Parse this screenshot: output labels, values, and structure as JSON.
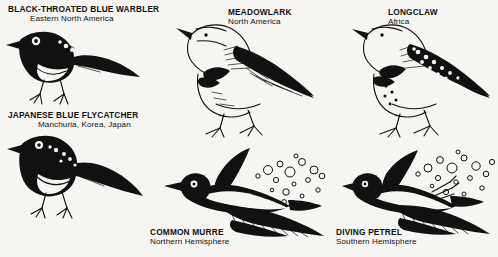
{
  "plate": {
    "title": "Convergent evolution in birds",
    "background_color": "#f6f5f1",
    "ink_color": "#111111",
    "style": "black-and-white scanned line engraving"
  },
  "specimens": [
    {
      "id": "black-throated-blue-warbler",
      "name": "BLACK-THROATED BLUE WARBLER",
      "range": "Eastern North America",
      "pose": "perched, facing left",
      "pair_group": "warbler-flycatcher"
    },
    {
      "id": "japanese-blue-flycatcher",
      "name": "JAPANESE BLUE FLYCATCHER",
      "range": "Manchuria, Korea, Japan",
      "pose": "perched, facing left",
      "pair_group": "warbler-flycatcher"
    },
    {
      "id": "meadowlark",
      "name": "MEADOWLARK",
      "range": "North America",
      "pose": "standing, facing left, black breast V",
      "pair_group": "meadowlark-longclaw"
    },
    {
      "id": "longclaw",
      "name": "LONGCLAW",
      "range": "Africa",
      "pose": "standing, facing left, black breast V",
      "pair_group": "meadowlark-longclaw"
    },
    {
      "id": "common-murre",
      "name": "COMMON MURRE",
      "range": "Northern Hemisphere",
      "pose": "swimming underwater, wings spread, bubble trail",
      "pair_group": "murre-petrel"
    },
    {
      "id": "diving-petrel",
      "name": "DIVING PETREL",
      "range": "Southern Hemisphere",
      "pose": "swimming underwater, wings spread, bubble trail",
      "pair_group": "murre-petrel"
    }
  ]
}
